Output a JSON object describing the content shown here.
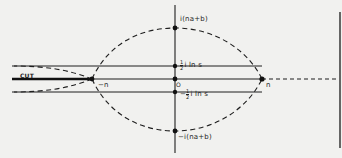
{
  "diagram": {
    "type": "complex-plane contour diagram",
    "labels": {
      "cut": "CUT",
      "neg_n": "−n",
      "pos_n": "n",
      "origin": "O",
      "top": "i(na+b)",
      "bottom": "−i(na+b)",
      "upper_line": {
        "sign": "",
        "num": "1",
        "den": "2",
        "text": "i ln s"
      },
      "lower_line": {
        "sign": "−",
        "num": "1",
        "den": "2",
        "text": "i ln s"
      }
    },
    "colors": {
      "background": "#f1f1ef",
      "ink": "#1e1e1e"
    }
  }
}
